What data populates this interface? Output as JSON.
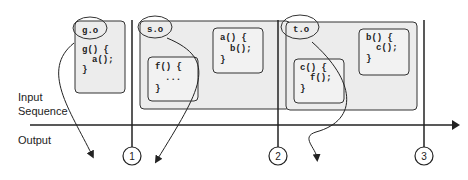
{
  "labels": {
    "input_line1": "Input",
    "input_line2": "Sequence",
    "output": "Output"
  },
  "objects": [
    {
      "name": "g.o",
      "functions": [
        {
          "lines": [
            "g() {",
            "  a();",
            "}"
          ]
        }
      ]
    },
    {
      "name": "s.o",
      "functions": [
        {
          "lines": [
            "f() {",
            "  ...",
            "}"
          ]
        },
        {
          "lines": [
            "a() {",
            "  b();",
            "}"
          ]
        }
      ]
    },
    {
      "name": "t.o",
      "functions": [
        {
          "lines": [
            "c() {",
            "  f();",
            "}"
          ]
        },
        {
          "lines": [
            "b() {",
            "  c();",
            "}"
          ]
        }
      ]
    }
  ],
  "markers": [
    "1",
    "2",
    "3"
  ],
  "colors": {
    "box_fill": "#ececec",
    "inner_fill": "#f2f2f2",
    "stroke": "#333333"
  }
}
